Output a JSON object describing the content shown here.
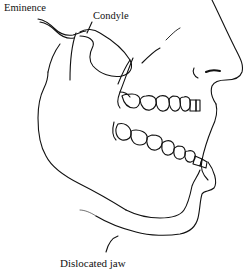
{
  "figure": {
    "labels": {
      "eminence": "Eminence",
      "condyle": "Condyle"
    },
    "caption": "Dislocated jaw",
    "colors": {
      "line": "#111111",
      "background": "#ffffff"
    }
  }
}
